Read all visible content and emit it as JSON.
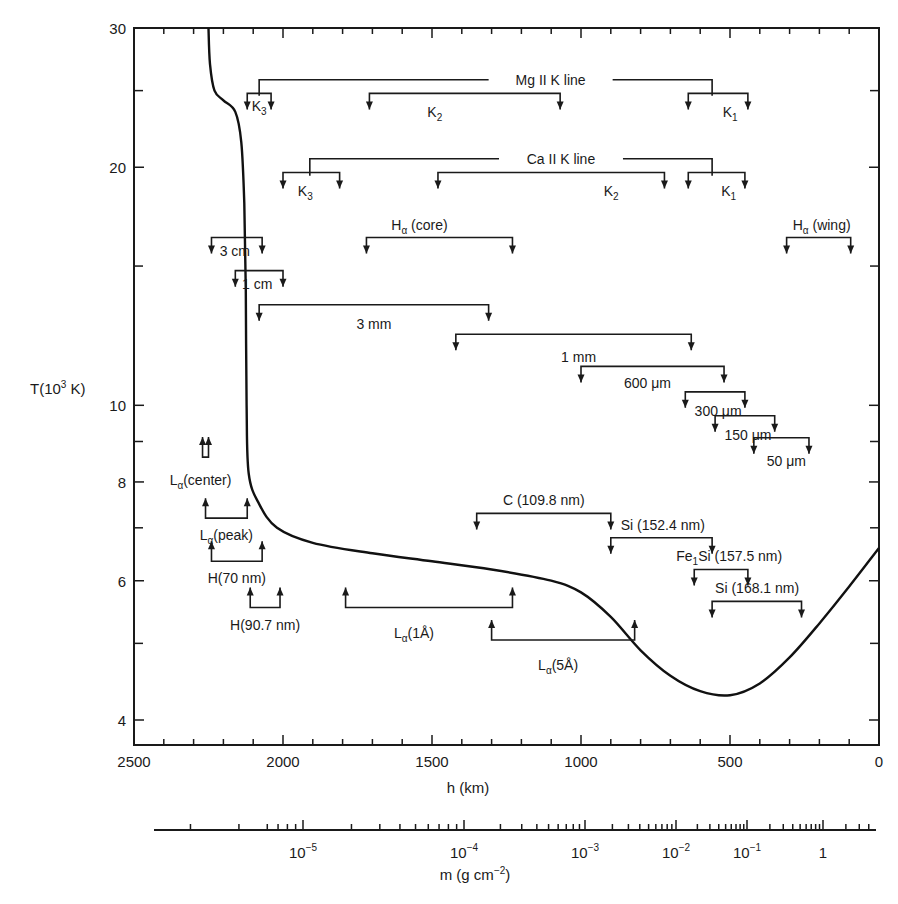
{
  "chart_data": {
    "type": "line",
    "title": "",
    "xlabel": "h (km)",
    "ylabel": "T(10^3 K)",
    "x_axis": {
      "range": [
        2500,
        0
      ],
      "reversed": true,
      "major_ticks": [
        2500,
        2000,
        1500,
        1000,
        500,
        0
      ],
      "minor_step": 100
    },
    "y_axis": {
      "scale": "log",
      "range": [
        3.6,
        30
      ],
      "major_ticks": [
        4,
        6,
        8,
        10,
        20,
        30
      ],
      "minor_ticks": [
        5,
        7,
        9,
        15,
        25
      ]
    },
    "secondary_x_axis": {
      "label": "m (g cm^-2)",
      "scale": "log",
      "tick_labels": [
        "10^-5",
        "10^-4",
        "10^-3",
        "10^-2",
        "10^-1",
        "1"
      ]
    },
    "grid": false,
    "legend": null,
    "series": [
      {
        "name": "Temperature T(h)",
        "points": [
          [
            2250,
            30.0
          ],
          [
            2245,
            27.0
          ],
          [
            2230,
            25.0
          ],
          [
            2200,
            24.3
          ],
          [
            2160,
            23.5
          ],
          [
            2140,
            21.5
          ],
          [
            2130,
            18.0
          ],
          [
            2125,
            14.0
          ],
          [
            2122,
            10.0
          ],
          [
            2115,
            8.2
          ],
          [
            2080,
            7.5
          ],
          [
            2020,
            7.0
          ],
          [
            1900,
            6.7
          ],
          [
            1700,
            6.5
          ],
          [
            1500,
            6.35
          ],
          [
            1300,
            6.2
          ],
          [
            1100,
            6.0
          ],
          [
            1000,
            5.8
          ],
          [
            900,
            5.4
          ],
          [
            800,
            4.9
          ],
          [
            700,
            4.55
          ],
          [
            600,
            4.35
          ],
          [
            500,
            4.3
          ],
          [
            400,
            4.45
          ],
          [
            300,
            4.8
          ],
          [
            200,
            5.3
          ],
          [
            100,
            5.9
          ],
          [
            0,
            6.6
          ]
        ]
      }
    ],
    "annotations": [
      {
        "label": "Mg II K line",
        "type": "group",
        "h_span": [
          2080,
          560
        ],
        "T": 25.8
      },
      {
        "label": "K3",
        "line": "Mg II",
        "h_range": [
          2120,
          2040
        ],
        "T": 24.8
      },
      {
        "label": "K2",
        "line": "Mg II",
        "h_range": [
          1710,
          1070
        ],
        "T": 24.8
      },
      {
        "label": "K1",
        "line": "Mg II",
        "h_range": [
          640,
          440
        ],
        "T": 24.8
      },
      {
        "label": "Ca II K line",
        "type": "group",
        "h_span": [
          1910,
          560
        ],
        "T": 20.5
      },
      {
        "label": "K3",
        "line": "Ca II",
        "h_range": [
          2000,
          1810
        ],
        "T": 19.7
      },
      {
        "label": "K2",
        "line": "Ca II",
        "h_range": [
          1480,
          720
        ],
        "T": 19.7
      },
      {
        "label": "K1",
        "line": "Ca II",
        "h_range": [
          640,
          450
        ],
        "T": 19.7
      },
      {
        "label": "Hα (core)",
        "h_range": [
          1720,
          1230
        ],
        "T": 16.3
      },
      {
        "label": "Hα (wing)",
        "h_range": [
          310,
          95
        ],
        "T": 16.3
      },
      {
        "label": "3 cm",
        "h_range": [
          2240,
          2070
        ],
        "T": 16.3
      },
      {
        "label": "1 cm",
        "h_range": [
          2160,
          2000
        ],
        "T": 14.8
      },
      {
        "label": "3 mm",
        "h_range": [
          2080,
          1310
        ],
        "T": 13.4
      },
      {
        "label": "1 mm",
        "h_range": [
          1420,
          630
        ],
        "T": 12.3
      },
      {
        "label": "600 μm",
        "h_range": [
          1000,
          520
        ],
        "T": 11.2
      },
      {
        "label": "300 μm",
        "h_range": [
          650,
          450
        ],
        "T": 10.4
      },
      {
        "label": "150 μm",
        "h_range": [
          550,
          350
        ],
        "T": 9.7
      },
      {
        "label": "50 μm",
        "h_range": [
          420,
          235
        ],
        "T": 9.1
      },
      {
        "label": "C (109.8 nm)",
        "h_range": [
          1350,
          900
        ],
        "T": 7.3
      },
      {
        "label": "Si (152.4 nm)",
        "h_range": [
          900,
          560
        ],
        "T": 6.8
      },
      {
        "label": "Fe1Si (157.5 nm)",
        "h_range": [
          620,
          440
        ],
        "T": 6.2
      },
      {
        "label": "Si (168.1 nm)",
        "h_range": [
          560,
          260
        ],
        "T": 5.65
      },
      {
        "label": "Lα(center)",
        "h_range": [
          2270,
          2250
        ],
        "T": 8.6,
        "direction": "up"
      },
      {
        "label": "Lα(peak)",
        "h_range": [
          2260,
          2120
        ],
        "T": 7.2,
        "direction": "up"
      },
      {
        "label": "H(70 nm)",
        "h_range": [
          2240,
          2070
        ],
        "T": 6.35,
        "direction": "up"
      },
      {
        "label": "H(90.7 nm)",
        "h_range": [
          2110,
          2010
        ],
        "T": 5.55,
        "direction": "up"
      },
      {
        "label": "Lα(1Å)",
        "h_range": [
          1790,
          1230
        ],
        "T": 5.55,
        "direction": "up"
      },
      {
        "label": "Lα(5Å)",
        "h_range": [
          1300,
          820
        ],
        "T": 5.05,
        "direction": "up"
      }
    ]
  },
  "labels": {
    "y_axis_title_main": "T(10",
    "y_axis_title_sup": "3",
    "y_axis_title_end": " K)",
    "x_axis_title": "h (km)",
    "m_axis_title_main": "m (g cm",
    "m_axis_title_sup": "−2",
    "m_axis_title_end": ")"
  }
}
